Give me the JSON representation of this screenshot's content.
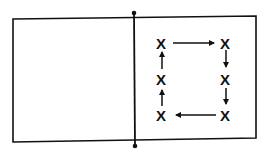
{
  "diagram": {
    "type": "court-drill",
    "colors": {
      "stroke": "#111111",
      "background": "#ffffff"
    },
    "court": {
      "outline": "rectangle",
      "center_line": "vertical line with end dots (net)"
    },
    "markers": [
      {
        "id": "top-left",
        "label": "X"
      },
      {
        "id": "top-right",
        "label": "X"
      },
      {
        "id": "mid-right",
        "label": "X"
      },
      {
        "id": "bottom-right",
        "label": "X"
      },
      {
        "id": "bottom-left",
        "label": "X"
      },
      {
        "id": "mid-left",
        "label": "X"
      }
    ],
    "arrows": [
      {
        "from": "top-left",
        "to": "top-right",
        "direction": "right"
      },
      {
        "from": "top-right",
        "to": "mid-right",
        "direction": "down"
      },
      {
        "from": "mid-right",
        "to": "bottom-right",
        "direction": "down"
      },
      {
        "from": "bottom-right",
        "to": "bottom-left",
        "direction": "left"
      },
      {
        "from": "bottom-left",
        "to": "mid-left",
        "direction": "up"
      },
      {
        "from": "mid-left",
        "to": "top-left",
        "direction": "up"
      }
    ],
    "rotation": "clockwise"
  }
}
